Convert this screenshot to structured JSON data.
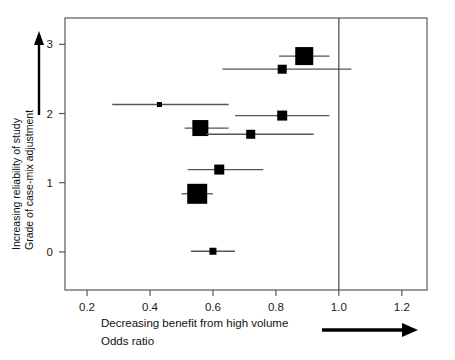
{
  "chart_data": {
    "type": "scatter",
    "title": "",
    "subtitle": "",
    "xlabel": "Decreasing benefit from high volume",
    "xlabel_line2": "Odds ratio",
    "ylabel": "Increasing reliability of study",
    "ylabel_line2": "Grade of case-mix adjustment",
    "xlim": [
      0.13,
      1.28
    ],
    "ylim": [
      -0.55,
      3.38
    ],
    "xticks": [
      0.2,
      0.4,
      0.6,
      0.8,
      1.0,
      1.2
    ],
    "xticklabels": [
      "0.2",
      "0.4",
      "0.6",
      "0.8",
      "1.0",
      "1.2"
    ],
    "yticks": [
      0,
      1,
      2,
      3
    ],
    "yticklabels": [
      "0",
      "1",
      "2",
      "3"
    ],
    "grid": false,
    "legend": "none",
    "reference_line": {
      "x": 1.0,
      "label": "1.0",
      "orientation": "vertical"
    },
    "marker_shape": "square",
    "marker_size_meaning": "study weight",
    "points": [
      {
        "y": 2.83,
        "odds_ratio": 0.89,
        "ci_low": 0.81,
        "ci_high": 0.97,
        "size": 18
      },
      {
        "y": 2.64,
        "odds_ratio": 0.82,
        "ci_low": 0.63,
        "ci_high": 1.04,
        "size": 9
      },
      {
        "y": 2.13,
        "odds_ratio": 0.43,
        "ci_low": 0.28,
        "ci_high": 0.65,
        "size": 5
      },
      {
        "y": 1.97,
        "odds_ratio": 0.82,
        "ci_low": 0.67,
        "ci_high": 0.97,
        "size": 10
      },
      {
        "y": 1.79,
        "odds_ratio": 0.56,
        "ci_low": 0.51,
        "ci_high": 0.65,
        "size": 16
      },
      {
        "y": 1.7,
        "odds_ratio": 0.72,
        "ci_low": 0.58,
        "ci_high": 0.92,
        "size": 9
      },
      {
        "y": 1.19,
        "odds_ratio": 0.62,
        "ci_low": 0.52,
        "ci_high": 0.76,
        "size": 10
      },
      {
        "y": 0.84,
        "odds_ratio": 0.55,
        "ci_low": 0.5,
        "ci_high": 0.6,
        "size": 20
      },
      {
        "y": 0.01,
        "odds_ratio": 0.6,
        "ci_low": 0.53,
        "ci_high": 0.67,
        "size": 7
      }
    ],
    "arrow_x": {
      "from": 0.78,
      "to": 1.2,
      "direction": "right"
    },
    "arrow_y": {
      "direction": "up"
    }
  },
  "colors": {
    "marker": "#000000",
    "whisker": "#555555",
    "frame": "#4a4a4a",
    "reference": "#333333",
    "text": "#111111",
    "background": "#ffffff"
  }
}
